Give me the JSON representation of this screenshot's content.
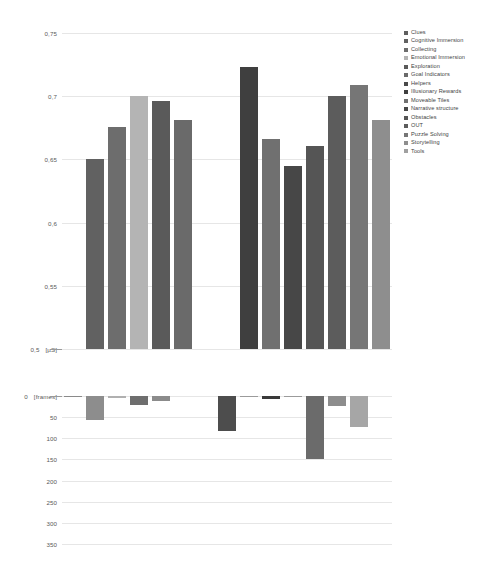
{
  "legend": {
    "position": "right",
    "items": [
      {
        "label": "Clues",
        "color": "#5e5e5e"
      },
      {
        "label": "Cognitive Immersion",
        "color": "#616161"
      },
      {
        "label": "Collecting",
        "color": "#6d6d6d"
      },
      {
        "label": "Emotional Immersion",
        "color": "#b4b4b4"
      },
      {
        "label": "Exploration",
        "color": "#5a5a5a"
      },
      {
        "label": "Goal Indicators",
        "color": "#6a6a6a"
      },
      {
        "label": "Helpers",
        "color": "#4a4a4a"
      },
      {
        "label": "Illusionary Rewards",
        "color": "#3e3e3e"
      },
      {
        "label": "Moveable Tiles",
        "color": "#707070"
      },
      {
        "label": "Narrative structure",
        "color": "#474747"
      },
      {
        "label": "Obstacles",
        "color": "#555555"
      },
      {
        "label": "OUT",
        "color": "#5c5c5c"
      },
      {
        "label": "Puzzle Solving",
        "color": "#767676"
      },
      {
        "label": "Storytelling",
        "color": "#8e8e8e"
      },
      {
        "label": "Tools",
        "color": "#a0a0a0"
      }
    ]
  },
  "caption": {
    "text": ""
  },
  "chart_data": [
    {
      "id": "top",
      "type": "bar",
      "title": "",
      "xlabel": "",
      "ylabel": "",
      "unit": "[µS]",
      "ylim": [
        0.5,
        0.75
      ],
      "ytick_labels": [
        "0,75",
        "0,7",
        "0,65",
        "0,6",
        "0,55",
        "0,5"
      ],
      "ytick_values": [
        0.75,
        0.7,
        0.65,
        0.6,
        0.55,
        0.5
      ],
      "grid": true,
      "baseline": 0.5,
      "categories": [
        "Clues",
        "Cognitive Immersion",
        "Collecting",
        "Emotional Immersion",
        "Exploration",
        "Goal Indicators",
        "Helpers",
        "Illusionary Rewards",
        "Moveable Tiles",
        "Narrative structure",
        "Obstacles",
        "OUT",
        "Puzzle Solving",
        "Storytelling",
        "Tools"
      ],
      "values": [
        0.5,
        0.65,
        0.676,
        0.7,
        0.696,
        0.681,
        0.5,
        0.5,
        0.723,
        0.666,
        0.645,
        0.661,
        0.7,
        0.709,
        0.681
      ],
      "colors": [
        "#5e5e5e",
        "#616161",
        "#6d6d6d",
        "#b4b4b4",
        "#5a5a5a",
        "#6a6a6a",
        "#4a4a4a",
        "#3e3e3e",
        "#3f3f3f",
        "#707070",
        "#474747",
        "#555555",
        "#5c5c5c",
        "#767676",
        "#8e8e8e"
      ]
    },
    {
      "id": "bottom",
      "type": "bar",
      "title": "",
      "xlabel": "",
      "ylabel": "",
      "unit": "[frames]",
      "ylim": [
        0,
        350
      ],
      "inverted": true,
      "ytick_labels": [
        "0",
        "50",
        "100",
        "150",
        "200",
        "250",
        "300",
        "350"
      ],
      "ytick_values": [
        0,
        50,
        100,
        150,
        200,
        250,
        300,
        350
      ],
      "grid": true,
      "baseline": 0,
      "categories": [
        "Clues",
        "Cognitive Immersion",
        "Collecting",
        "Emotional Immersion",
        "Exploration",
        "Goal Indicators",
        "Helpers",
        "Illusionary Rewards",
        "Moveable Tiles",
        "Narrative structure",
        "Obstacles",
        "OUT",
        "Puzzle Solving",
        "Storytelling",
        "Tools"
      ],
      "values": [
        2,
        57,
        5,
        22,
        13,
        0,
        0,
        82,
        3,
        6,
        2,
        148,
        23,
        73,
        0
      ],
      "colors": [
        "#8a8a8a",
        "#8d8d8d",
        "#b0b0b0",
        "#6e6e6e",
        "#8b8b8b",
        "#8a8a8a",
        "#8a8a8a",
        "#4d4d4d",
        "#9b9b9b",
        "#3a3a3a",
        "#9b9b9b",
        "#6b6b6b",
        "#8d8d8d",
        "#a6a6a6",
        "#8a8a8a"
      ]
    }
  ]
}
